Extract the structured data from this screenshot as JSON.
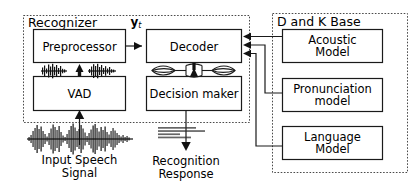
{
  "diagram": {
    "groups": [
      {
        "id": "recognizer",
        "label": "Recognizer"
      },
      {
        "id": "dk_base",
        "label": "D and K Base"
      }
    ],
    "blocks": [
      {
        "id": "preprocessor",
        "label": "Preprocessor"
      },
      {
        "id": "vad",
        "label": "VAD"
      },
      {
        "id": "decoder",
        "label": "Decoder"
      },
      {
        "id": "decision_maker",
        "label": "Decision maker"
      },
      {
        "id": "acoustic_model",
        "line1": "Acoustic",
        "line2": "Model"
      },
      {
        "id": "pronunciation_model",
        "line1": "Pronunciation",
        "line2": "model"
      },
      {
        "id": "language_model",
        "line1": "Language",
        "line2": "Model"
      }
    ],
    "signal_label": {
      "symbol": "y",
      "subscript": "t"
    },
    "captions": [
      {
        "id": "input_speech_signal",
        "line1": "Input Speech",
        "line2": "Signal"
      },
      {
        "id": "recognition_response",
        "line1": "Recognition",
        "line2": "Response"
      }
    ],
    "icons": [
      {
        "id": "input-waveform-icon",
        "name": "audio-waveform-icon"
      },
      {
        "id": "framed-waveform-icon",
        "name": "audio-waveform-icon"
      },
      {
        "id": "lattice-icon",
        "name": "word-lattice-icon"
      },
      {
        "id": "transcript-icon",
        "name": "transcript-text-icon"
      }
    ],
    "colors": {
      "stroke": "#1a1a1a",
      "dashed_stroke": "#4a4a4a",
      "background": "#ffffff",
      "text": "#000000"
    }
  }
}
